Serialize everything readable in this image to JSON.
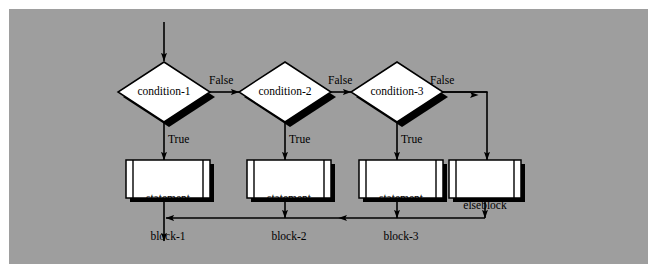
{
  "diagram": {
    "background_color": "#9e9e9e",
    "frame_color": "#ffffff",
    "line_color": "#000000",
    "node_fill": "#ffffff",
    "shadow_color": "#000000",
    "decisions": [
      {
        "id": "condition-1",
        "label": "condition-1"
      },
      {
        "id": "condition-2",
        "label": "condition-2"
      },
      {
        "id": "condition-3",
        "label": "condition-3"
      }
    ],
    "processes": [
      {
        "id": "statement-block-1",
        "line1": "statement",
        "line2": "block-1"
      },
      {
        "id": "statement-block-2",
        "line1": "statement",
        "line2": "block-2"
      },
      {
        "id": "statement-block-3",
        "line1": "statement",
        "line2": "block-3"
      },
      {
        "id": "elseblock",
        "line1": "elseblock",
        "line2": ""
      }
    ],
    "edge_labels": {
      "false_1": "False",
      "false_2": "False",
      "false_3": "False",
      "true_1": "True",
      "true_2": "True",
      "true_3": "True"
    }
  }
}
